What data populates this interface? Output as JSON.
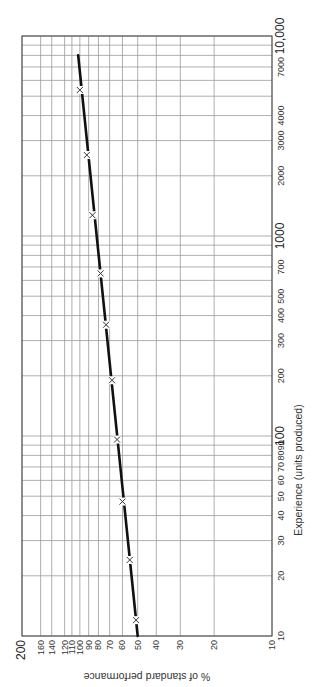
{
  "chart_data": {
    "type": "line",
    "title": "",
    "orientation": "rotated-90",
    "xlabel": "Experience (units produced)",
    "ylabel": "% of standard performance",
    "x_scale": "log",
    "y_scale": "log",
    "xlim": [
      10,
      10000
    ],
    "ylim": [
      10,
      200
    ],
    "grid": true,
    "x_tick_labels": [
      "10",
      "20",
      "30",
      "40",
      "50",
      "60",
      "70",
      "80",
      "90",
      "100",
      "200",
      "300",
      "400",
      "500",
      "700",
      "1000",
      "2000",
      "3000",
      "4000",
      "7000",
      "10,000"
    ],
    "y_tick_labels": [
      "200",
      "160",
      "140",
      "120",
      "110",
      "100",
      "90",
      "80",
      "70",
      "60",
      "50",
      "40",
      "30",
      "20",
      "10"
    ],
    "series": [
      {
        "name": "Learning curve",
        "marker": "x",
        "points": [
          {
            "x": 12,
            "y": 51
          },
          {
            "x": 24,
            "y": 55
          },
          {
            "x": 47,
            "y": 60
          },
          {
            "x": 96,
            "y": 64
          },
          {
            "x": 190,
            "y": 68
          },
          {
            "x": 360,
            "y": 73
          },
          {
            "x": 650,
            "y": 78
          },
          {
            "x": 1270,
            "y": 86
          },
          {
            "x": 2540,
            "y": 92
          },
          {
            "x": 5370,
            "y": 100
          }
        ],
        "fit_line": [
          {
            "x": 10,
            "y": 50
          },
          {
            "x": 8000,
            "y": 102
          }
        ]
      }
    ]
  },
  "colors": {
    "grid": "#9a9a9a",
    "frame": "#444444",
    "line": "#111111",
    "marker": "#333333"
  }
}
